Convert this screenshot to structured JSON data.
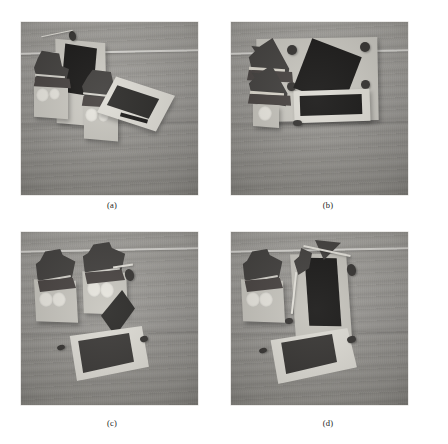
{
  "figure": {
    "kind": "photo-grid",
    "columns": 2,
    "rows": 2,
    "background_color": "#ffffff",
    "panels": [
      {
        "id": "a",
        "caption": "(a)",
        "alt": "Grayscale photograph of folded paper objects on a wooden table: two dark angular shapes on light blocks with white circular markings, and an upright light panel bearing a dark quadrilateral patch",
        "scene_colors": {
          "surface": "#9c9a96",
          "card": "#d6d4cd",
          "dark_shape": "#454341",
          "ink_patch": "#2e2d2b"
        }
      },
      {
        "id": "b",
        "caption": "(b)",
        "alt": "Grayscale photograph: two stacked dark triangular shapes at left, a large black diamond patch on a light board, a framed dark rectangle at lower right, and four small dark dots at the board corners",
        "scene_colors": {
          "surface": "#9c9a96",
          "card": "#d6d4cd",
          "dark_shape": "#454341",
          "ink_patch": "#1d1c1b"
        }
      },
      {
        "id": "c",
        "caption": "(c)",
        "alt": "Grayscale photograph: two dark angular house-like shapes on light blocks with white circles, a tilted black diamond, and a flat light board framing a dark square lying on the table",
        "scene_colors": {
          "surface": "#9c9a96",
          "card": "#d6d4cd",
          "dark_shape": "#454341",
          "ink_patch": "#2e2d2b"
        }
      },
      {
        "id": "d",
        "caption": "(d)",
        "alt": "Grayscale photograph: a dark angular shape on a light block at left, an upright light panel with a tall black rectangle, a small dark triangle on a thin stick, and a flat light board framing a dark square",
        "scene_colors": {
          "surface": "#9c9a96",
          "card": "#d6d4cd",
          "dark_shape": "#454341",
          "ink_patch": "#1d1c1b"
        }
      }
    ]
  }
}
